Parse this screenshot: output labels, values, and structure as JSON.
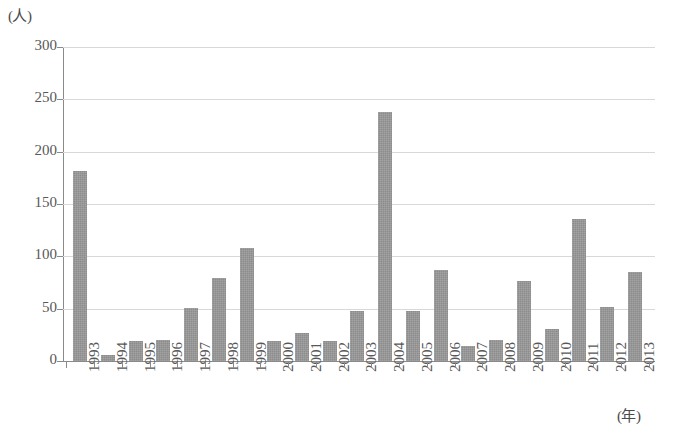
{
  "chart_data": {
    "type": "bar",
    "title": "",
    "subtitle": "",
    "xlabel": "(年)",
    "ylabel": "(人)",
    "categories": [
      "1993",
      "1994",
      "1995",
      "1996",
      "1997",
      "1998",
      "1999",
      "2000",
      "2001",
      "2002",
      "2003",
      "2004",
      "2005",
      "2006",
      "2007",
      "2008",
      "2009",
      "2010",
      "2011",
      "2012",
      "2013"
    ],
    "values": [
      182,
      6,
      19,
      20,
      51,
      79,
      108,
      19,
      27,
      19,
      48,
      238,
      48,
      87,
      14,
      20,
      76,
      31,
      136,
      52,
      85
    ],
    "series": [
      {
        "name": "人数",
        "values": [
          182,
          6,
          19,
          20,
          51,
          79,
          108,
          19,
          27,
          19,
          48,
          238,
          48,
          87,
          14,
          20,
          76,
          31,
          136,
          52,
          85
        ]
      }
    ],
    "ylim": [
      0,
      300
    ],
    "yticks": [
      0,
      50,
      100,
      150,
      200,
      250,
      300
    ],
    "ytick_labels": [
      "0",
      "50",
      "100",
      "150",
      "200",
      "250",
      "300"
    ],
    "grid": "horizontal",
    "legend": "none",
    "bar_color": "#8c8c8c",
    "gridline_color": "#d8d8d8",
    "axis_color": "#8a8a8a",
    "annotations": []
  }
}
